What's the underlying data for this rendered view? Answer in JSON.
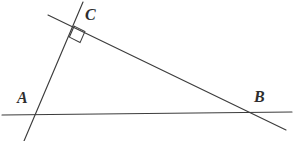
{
  "figure": {
    "background_color": "#ffffff",
    "stroke_color": "#3c3c3c",
    "label_color": "#2e2e2e",
    "width": 296,
    "height": 141
  },
  "labels": {
    "a": "A",
    "b": "B",
    "c": "C"
  },
  "points": {
    "A": {
      "x": 31,
      "y": 114
    },
    "B": {
      "x": 253,
      "y": 113
    },
    "C": {
      "x": 76,
      "y": 22
    }
  },
  "lines": [
    {
      "name": "line-AB-horizontal",
      "from": {
        "x": 2,
        "y": 115
      },
      "to": {
        "x": 292,
        "y": 112
      },
      "through": [
        "A",
        "B"
      ]
    },
    {
      "name": "line-AC",
      "from": {
        "x": 24,
        "y": 141
      },
      "to": {
        "x": 83,
        "y": 2
      },
      "through": [
        "A",
        "C"
      ]
    },
    {
      "name": "line-CB",
      "from": {
        "x": 48,
        "y": 15
      },
      "to": {
        "x": 286,
        "y": 130
      },
      "through": [
        "C",
        "B"
      ]
    }
  ],
  "angle_marker": {
    "name": "right-angle-at-C",
    "at_vertex": "C",
    "type": "right-angle-square",
    "measure": "90"
  },
  "chart_data": {
    "type": "diagram",
    "vertices": [
      {
        "label": "A",
        "x": 31,
        "y": 114
      },
      {
        "label": "B",
        "x": 253,
        "y": 113
      },
      {
        "label": "C",
        "x": 76,
        "y": 22
      }
    ],
    "segments": [
      {
        "name": "AB",
        "endpoints": [
          "A",
          "B"
        ]
      },
      {
        "name": "AC",
        "endpoints": [
          "A",
          "C"
        ]
      },
      {
        "name": "CB",
        "endpoints": [
          "C",
          "B"
        ]
      }
    ],
    "annotations": [
      {
        "type": "right-angle",
        "vertex": "C",
        "degrees": 90
      }
    ]
  }
}
